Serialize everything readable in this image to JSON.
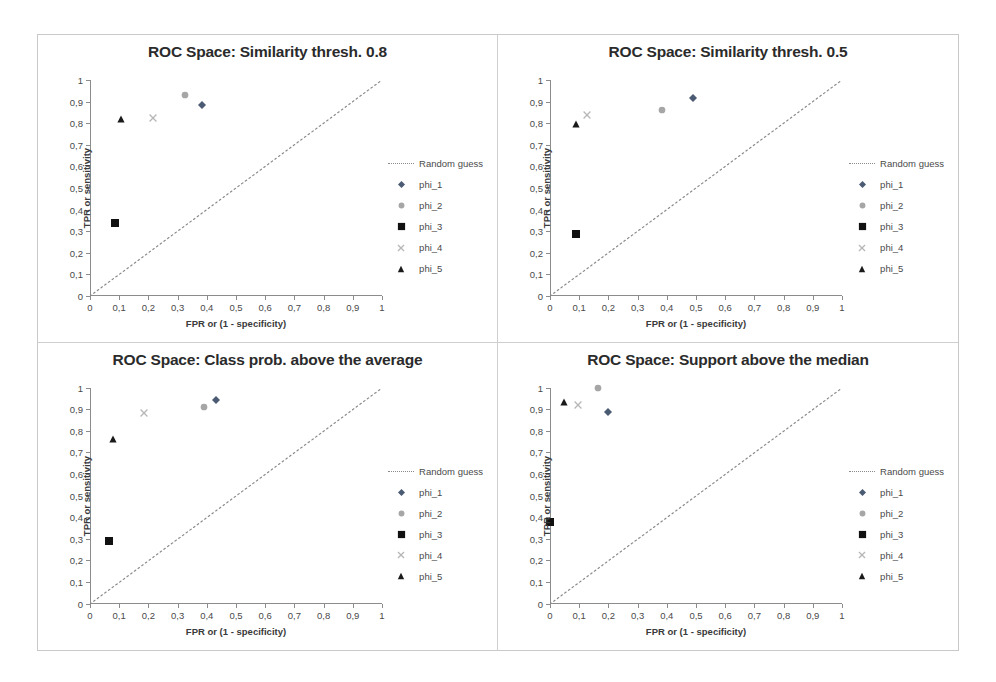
{
  "figure": {
    "series_names": [
      "phi_1",
      "phi_2",
      "phi_3",
      "phi_4",
      "phi_5"
    ],
    "random_guess_label": "Random guess",
    "xlabel": "FPR or (1 - specificity)",
    "ylabel": "TPR or sensitivity",
    "tick_labels": [
      "0",
      "0,1",
      "0,2",
      "0,3",
      "0,4",
      "0,5",
      "0,6",
      "0,7",
      "0,8",
      "0,9",
      "1"
    ],
    "colors": {
      "phi_1": "#4a5b73",
      "phi_2": "#a6a6a6",
      "phi_3": "#111111",
      "phi_4": "#b7b7b7",
      "phi_5": "#1a1a1a",
      "random_guess": "#8a8a8a",
      "axis": "#8c8c8c",
      "title": "#2b2b2b",
      "panel_border": "#c9c9c9"
    }
  },
  "chart_data": [
    {
      "type": "scatter",
      "title": "ROC Space: Similarity thresh. 0.8",
      "xlabel": "FPR or (1 - specificity)",
      "ylabel": "TPR or sensitivity",
      "xlim": [
        0,
        1
      ],
      "ylim": [
        0,
        1
      ],
      "xticks": [
        0,
        0.1,
        0.2,
        0.3,
        0.4,
        0.5,
        0.6,
        0.7,
        0.8,
        0.9,
        1
      ],
      "yticks": [
        0,
        0.1,
        0.2,
        0.3,
        0.4,
        0.5,
        0.6,
        0.7,
        0.8,
        0.9,
        1
      ],
      "grid": false,
      "legend_position": "right",
      "reference_line": {
        "label": "Random guess",
        "from": [
          0,
          0
        ],
        "to": [
          1,
          1
        ],
        "style": "dotted"
      },
      "series": [
        {
          "name": "phi_1",
          "marker": "diamond",
          "x": 0.385,
          "y": 0.885
        },
        {
          "name": "phi_2",
          "marker": "circle",
          "x": 0.325,
          "y": 0.93
        },
        {
          "name": "phi_3",
          "marker": "square",
          "x": 0.085,
          "y": 0.34
        },
        {
          "name": "phi_4",
          "marker": "cross",
          "x": 0.215,
          "y": 0.825
        },
        {
          "name": "phi_5",
          "marker": "triangle",
          "x": 0.105,
          "y": 0.82
        }
      ]
    },
    {
      "type": "scatter",
      "title": "ROC Space: Similarity thresh. 0.5",
      "xlabel": "FPR or (1 - specificity)",
      "ylabel": "TPR or sensitivity",
      "xlim": [
        0,
        1
      ],
      "ylim": [
        0,
        1
      ],
      "xticks": [
        0,
        0.1,
        0.2,
        0.3,
        0.4,
        0.5,
        0.6,
        0.7,
        0.8,
        0.9,
        1
      ],
      "yticks": [
        0,
        0.1,
        0.2,
        0.3,
        0.4,
        0.5,
        0.6,
        0.7,
        0.8,
        0.9,
        1
      ],
      "grid": false,
      "legend_position": "right",
      "reference_line": {
        "label": "Random guess",
        "from": [
          0,
          0
        ],
        "to": [
          1,
          1
        ],
        "style": "dotted"
      },
      "series": [
        {
          "name": "phi_1",
          "marker": "diamond",
          "x": 0.49,
          "y": 0.918
        },
        {
          "name": "phi_2",
          "marker": "circle",
          "x": 0.385,
          "y": 0.86
        },
        {
          "name": "phi_3",
          "marker": "square",
          "x": 0.09,
          "y": 0.285
        },
        {
          "name": "phi_4",
          "marker": "cross",
          "x": 0.125,
          "y": 0.84
        },
        {
          "name": "phi_5",
          "marker": "triangle",
          "x": 0.09,
          "y": 0.795
        }
      ]
    },
    {
      "type": "scatter",
      "title": "ROC Space: Class prob. above the average",
      "xlabel": "FPR or (1 - specificity)",
      "ylabel": "TPR or sensitivity",
      "xlim": [
        0,
        1
      ],
      "ylim": [
        0,
        1
      ],
      "xticks": [
        0,
        0.1,
        0.2,
        0.3,
        0.4,
        0.5,
        0.6,
        0.7,
        0.8,
        0.9,
        1
      ],
      "yticks": [
        0,
        0.1,
        0.2,
        0.3,
        0.4,
        0.5,
        0.6,
        0.7,
        0.8,
        0.9,
        1
      ],
      "grid": false,
      "legend_position": "right",
      "reference_line": {
        "label": "Random guess",
        "from": [
          0,
          0
        ],
        "to": [
          1,
          1
        ],
        "style": "dotted"
      },
      "series": [
        {
          "name": "phi_1",
          "marker": "diamond",
          "x": 0.43,
          "y": 0.943
        },
        {
          "name": "phi_2",
          "marker": "circle",
          "x": 0.39,
          "y": 0.908
        },
        {
          "name": "phi_3",
          "marker": "square",
          "x": 0.065,
          "y": 0.288
        },
        {
          "name": "phi_4",
          "marker": "cross",
          "x": 0.185,
          "y": 0.883
        },
        {
          "name": "phi_5",
          "marker": "triangle",
          "x": 0.08,
          "y": 0.76
        }
      ]
    },
    {
      "type": "scatter",
      "title": "ROC Space: Support above the median",
      "xlabel": "FPR or (1 - specificity)",
      "ylabel": "TPR or sensitivity",
      "xlim": [
        0,
        1
      ],
      "ylim": [
        0,
        1
      ],
      "xticks": [
        0,
        0.1,
        0.2,
        0.3,
        0.4,
        0.5,
        0.6,
        0.7,
        0.8,
        0.9,
        1
      ],
      "yticks": [
        0,
        0.1,
        0.2,
        0.3,
        0.4,
        0.5,
        0.6,
        0.7,
        0.8,
        0.9,
        1
      ],
      "grid": false,
      "legend_position": "right",
      "reference_line": {
        "label": "Random guess",
        "from": [
          0,
          0
        ],
        "to": [
          1,
          1
        ],
        "style": "dotted"
      },
      "series": [
        {
          "name": "phi_1",
          "marker": "diamond",
          "x": 0.2,
          "y": 0.885
        },
        {
          "name": "phi_2",
          "marker": "circle",
          "x": 0.165,
          "y": 1.0
        },
        {
          "name": "phi_3",
          "marker": "square",
          "x": 0.0,
          "y": 0.378
        },
        {
          "name": "phi_4",
          "marker": "cross",
          "x": 0.095,
          "y": 0.92
        },
        {
          "name": "phi_5",
          "marker": "triangle",
          "x": 0.048,
          "y": 0.933
        }
      ]
    }
  ]
}
